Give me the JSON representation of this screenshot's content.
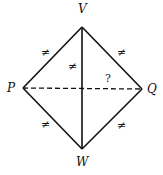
{
  "diagram": {
    "type": "geometry-quadrilateral",
    "vertices": [
      {
        "id": "V",
        "label": "V",
        "x": 82,
        "y": 27
      },
      {
        "id": "P",
        "label": "P",
        "x": 23,
        "y": 88
      },
      {
        "id": "Q",
        "label": "Q",
        "x": 142,
        "y": 89
      },
      {
        "id": "W",
        "label": "W",
        "x": 82,
        "y": 149
      }
    ],
    "edges": [
      {
        "from": "P",
        "to": "V",
        "style": "solid",
        "mark": "≠"
      },
      {
        "from": "V",
        "to": "Q",
        "style": "solid",
        "mark": "≠"
      },
      {
        "from": "P",
        "to": "W",
        "style": "solid",
        "mark": "≠"
      },
      {
        "from": "W",
        "to": "Q",
        "style": "solid",
        "mark": "≠"
      },
      {
        "from": "V",
        "to": "W",
        "style": "solid",
        "mark": "≠"
      },
      {
        "from": "P",
        "to": "Q",
        "style": "dashed",
        "mark": "?"
      }
    ],
    "labels": {
      "V": "V",
      "P": "P",
      "Q": "Q",
      "W": "W"
    },
    "marks": {
      "pv": "≠",
      "vq": "≠",
      "pw": "≠",
      "wq": "≠",
      "vw": "≠",
      "pq": "?"
    }
  }
}
